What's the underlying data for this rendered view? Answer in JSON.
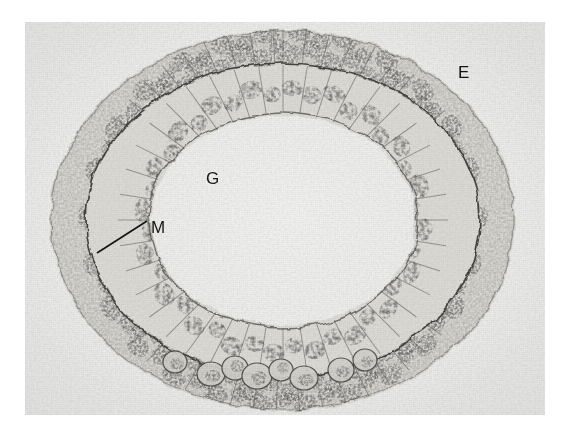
{
  "figure": {
    "kind": "histological-micrograph",
    "modality": "light-microscopy",
    "staining": "monochrome halftone print",
    "background_color": "#ffffff",
    "plate_color": "#efefee",
    "ink_color": "#151515"
  },
  "labels": [
    {
      "id": "E",
      "text": "E",
      "meaning": "epithelium",
      "x": 458,
      "y": 64,
      "has_leader": false
    },
    {
      "id": "G",
      "text": "G",
      "meaning": "gut lumen / glandular fold",
      "x": 206,
      "y": 170,
      "has_leader": false
    },
    {
      "id": "M",
      "text": "M",
      "meaning": "muscle layer",
      "x": 151,
      "y": 219,
      "has_leader": true
    }
  ],
  "leader_lines": [
    {
      "for": "M",
      "x1": 147,
      "y1": 221,
      "x2": 97,
      "y2": 253
    }
  ],
  "plate": {
    "left": 25,
    "top": 22,
    "width": 520,
    "height": 393
  },
  "structures": [
    {
      "name": "outer-cell-band",
      "role": "outer ring of densely nucleated cells"
    },
    {
      "name": "basement-membrane-line",
      "role": "thin dark line separating outer band from inner epithelium"
    },
    {
      "name": "inner-epithelium-folds",
      "role": "folded columnar epithelium projecting into the lumen"
    },
    {
      "name": "central-lumen",
      "role": "empty pale cavity at the centre of the section"
    }
  ]
}
